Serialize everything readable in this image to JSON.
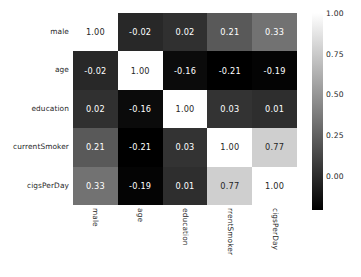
{
  "chart_data": {
    "type": "heatmap",
    "title": "",
    "xlabel": "",
    "ylabel": "",
    "categories": [
      "male",
      "age",
      "education",
      "currentSmoker",
      "cigsPerDay"
    ],
    "x_tick_labels": [
      "male",
      "age",
      "education",
      "rrentSmoker",
      "cigsPerDay"
    ],
    "y_tick_labels": [
      "male",
      "age",
      "education",
      "currentSmoker",
      "cigsPerDay"
    ],
    "annotation_format": "0.00",
    "colormap": "gray",
    "colorbar": {
      "orientation": "vertical",
      "position": "right",
      "min": -0.21,
      "max": 1.0,
      "ticks": [
        "1.00",
        "0.75",
        "0.50",
        "0.25",
        "0.00"
      ],
      "tick_values": [
        1.0,
        0.75,
        0.5,
        0.25,
        0.0
      ],
      "low_color": "#000000",
      "high_color": "#ffffff"
    },
    "grid": false,
    "legend": "none",
    "rows": [
      {
        "label": "male",
        "cells": [
          {
            "col": "male",
            "value": 1.0,
            "text": "1.00"
          },
          {
            "col": "age",
            "value": -0.02,
            "text": "-0.02"
          },
          {
            "col": "education",
            "value": 0.02,
            "text": "0.02"
          },
          {
            "col": "currentSmoker",
            "value": 0.21,
            "text": "0.21"
          },
          {
            "col": "cigsPerDay",
            "value": 0.33,
            "text": "0.33"
          }
        ]
      },
      {
        "label": "age",
        "cells": [
          {
            "col": "male",
            "value": -0.02,
            "text": "-0.02"
          },
          {
            "col": "age",
            "value": 1.0,
            "text": "1.00"
          },
          {
            "col": "education",
            "value": -0.16,
            "text": "-0.16"
          },
          {
            "col": "currentSmoker",
            "value": -0.21,
            "text": "-0.21"
          },
          {
            "col": "cigsPerDay",
            "value": -0.19,
            "text": "-0.19"
          }
        ]
      },
      {
        "label": "education",
        "cells": [
          {
            "col": "male",
            "value": 0.02,
            "text": "0.02"
          },
          {
            "col": "age",
            "value": -0.16,
            "text": "-0.16"
          },
          {
            "col": "education",
            "value": 1.0,
            "text": "1.00"
          },
          {
            "col": "currentSmoker",
            "value": 0.03,
            "text": "0.03"
          },
          {
            "col": "cigsPerDay",
            "value": 0.01,
            "text": "0.01"
          }
        ]
      },
      {
        "label": "currentSmoker",
        "cells": [
          {
            "col": "male",
            "value": 0.21,
            "text": "0.21"
          },
          {
            "col": "age",
            "value": -0.21,
            "text": "-0.21"
          },
          {
            "col": "education",
            "value": 0.03,
            "text": "0.03"
          },
          {
            "col": "currentSmoker",
            "value": 1.0,
            "text": "1.00"
          },
          {
            "col": "cigsPerDay",
            "value": 0.77,
            "text": "0.77"
          }
        ]
      },
      {
        "label": "cigsPerDay",
        "cells": [
          {
            "col": "male",
            "value": 0.33,
            "text": "0.33"
          },
          {
            "col": "age",
            "value": -0.19,
            "text": "-0.19"
          },
          {
            "col": "education",
            "value": 0.01,
            "text": "0.01"
          },
          {
            "col": "currentSmoker",
            "value": 0.77,
            "text": "0.77"
          },
          {
            "col": "cigsPerDay",
            "value": 1.0,
            "text": "1.00"
          }
        ]
      }
    ]
  }
}
